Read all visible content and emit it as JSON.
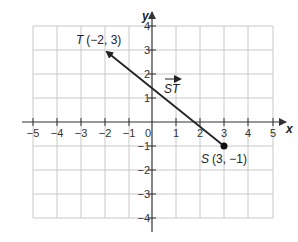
{
  "diagram": {
    "type": "coordinate-plane-vector",
    "axes": {
      "x_label": "x",
      "y_label": "y",
      "x_range": [
        -5,
        5
      ],
      "y_range": [
        -4,
        4
      ],
      "x_ticks": [
        "−5",
        "−4",
        "−3",
        "−2",
        "−1",
        "1",
        "2",
        "3",
        "4",
        "5"
      ],
      "y_ticks": [
        "4",
        "3",
        "2",
        "1",
        "−1",
        "−2",
        "−3",
        "−4"
      ],
      "origin_label": "0",
      "grid": true
    },
    "vector": {
      "label": "ST",
      "tail": {
        "name": "S",
        "coords": "(3, −1)",
        "x": 3,
        "y": -1
      },
      "head": {
        "name": "T",
        "coords": "(−2, 3)",
        "x": -2,
        "y": 3
      }
    },
    "colors": {
      "grid": "#c8c8c8",
      "axis": "#333333",
      "vector": "#222222",
      "text": "#222222"
    }
  }
}
